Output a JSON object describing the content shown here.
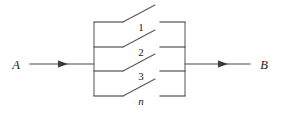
{
  "diagram": {
    "type": "parallel-switch-network",
    "terminals": {
      "input": {
        "label": "A",
        "x": 16,
        "y": 64,
        "lead_from": 30,
        "lead_to": 94,
        "arrow_x": 62
      },
      "output": {
        "label": "B",
        "x": 262,
        "y": 64,
        "lead_from": 185,
        "lead_to": 250,
        "arrow_x": 222
      }
    },
    "bus": {
      "left_x": 94,
      "right_x": 185,
      "top_y": 22,
      "bottom_y": 96,
      "color": "#6a6a6a"
    },
    "branches": [
      {
        "label": "1",
        "italic": false,
        "y": 22,
        "label_x": 141,
        "label_y": 31
      },
      {
        "label": "2",
        "italic": false,
        "y": 47,
        "label_x": 141,
        "label_y": 56
      },
      {
        "label": "3",
        "italic": false,
        "y": 71,
        "label_x": 141,
        "label_y": 80
      },
      {
        "label": "n",
        "italic": true,
        "y": 96,
        "label_x": 141,
        "label_y": 104
      }
    ],
    "switch_geometry": {
      "left_contact_x": 123,
      "right_contact_x": 160,
      "blade_tip_dx": 32,
      "blade_rise": 17,
      "state": "open"
    },
    "colors": {
      "wire": "#4a4a4a",
      "bus": "#6a6a6a",
      "blade": "#5a5a5a",
      "text": "#1a1a1a",
      "background": "#ffffff"
    }
  }
}
